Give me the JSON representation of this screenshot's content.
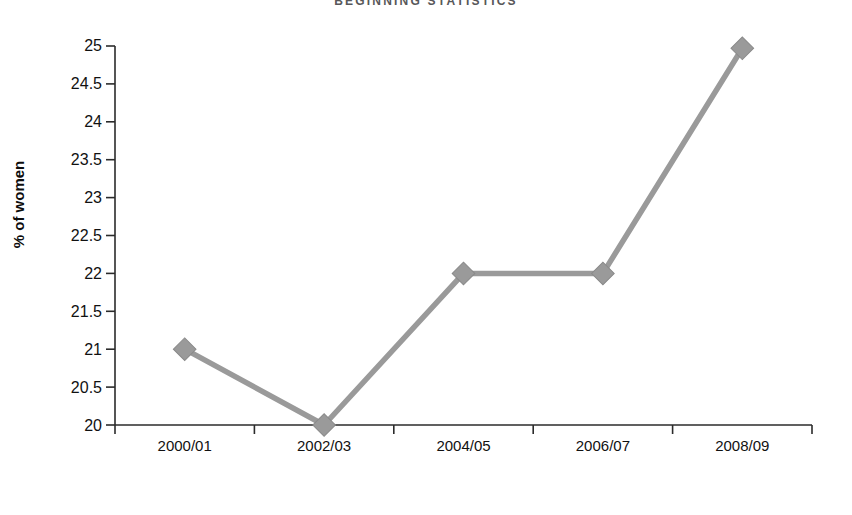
{
  "chart_data": {
    "type": "line",
    "title": "BEGINNING STATISTICS",
    "xlabel": "Year",
    "ylabel": "% of women",
    "categories": [
      "2000/01",
      "2002/03",
      "2004/05",
      "2006/07",
      "2008/09"
    ],
    "values": [
      21,
      20,
      22,
      22,
      24.97
    ],
    "series": [
      {
        "name": "% of women",
        "values": [
          21,
          20,
          22,
          22,
          24.97
        ]
      }
    ],
    "ylim": [
      20,
      25
    ],
    "ytick_labels": [
      "25",
      "24.5",
      "24",
      "23.5",
      "23",
      "22.5",
      "22",
      "21.5",
      "21",
      "20.5",
      "20"
    ],
    "ytick_values": [
      25,
      24.5,
      24,
      23.5,
      23,
      22.5,
      22,
      21.5,
      21,
      20.5,
      20
    ],
    "grid": false,
    "legend": "none",
    "marker": "diamond",
    "line_color": "#9a9a9a",
    "marker_color": "#9a9a9a",
    "axis_color": "#2b2b2b",
    "text_color": "#111111"
  }
}
